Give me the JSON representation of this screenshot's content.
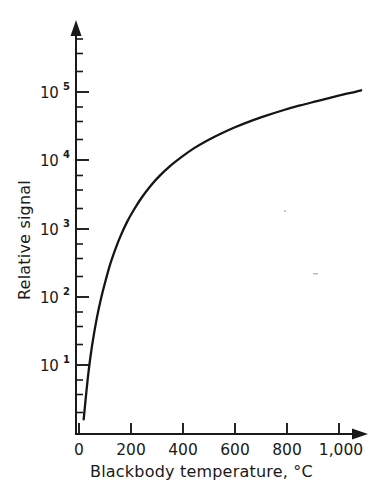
{
  "chart_data": {
    "type": "line",
    "title": "",
    "xlabel": "Blackbody temperature, °C",
    "ylabel": "Relative signal",
    "xlim": [
      0,
      1100
    ],
    "ylim": [
      1,
      200000
    ],
    "yscale": "log",
    "xscale": "linear",
    "grid": false,
    "legend": null,
    "x_ticks": [
      {
        "value": 0,
        "label": "0"
      },
      {
        "value": 200,
        "label": "200"
      },
      {
        "value": 400,
        "label": "400"
      },
      {
        "value": 600,
        "label": "600"
      },
      {
        "value": 800,
        "label": "800"
      },
      {
        "value": 1000,
        "label": "1,000"
      }
    ],
    "y_ticks": [
      {
        "value": 10,
        "mantissa": "10",
        "exponent": "1",
        "label": "10¹"
      },
      {
        "value": 100,
        "mantissa": "10",
        "exponent": "2",
        "label": "10²"
      },
      {
        "value": 1000,
        "mantissa": "10",
        "exponent": "3",
        "label": "10³"
      },
      {
        "value": 10000,
        "mantissa": "10",
        "exponent": "4",
        "label": "10⁴"
      },
      {
        "value": 100000,
        "mantissa": "10",
        "exponent": "5",
        "label": "10⁵"
      }
    ],
    "series": [
      {
        "name": "Relative signal",
        "x": [
          18,
          25,
          35,
          45,
          55,
          70,
          85,
          100,
          120,
          140,
          160,
          185,
          210,
          240,
          275,
          310,
          350,
          395,
          440,
          490,
          545,
          600,
          660,
          720,
          785,
          850,
          915,
          980,
          1040,
          1085
        ],
        "y": [
          1.6,
          3.0,
          7.0,
          14,
          25,
          52,
          95,
          160,
          300,
          500,
          780,
          1250,
          1850,
          2800,
          4200,
          5900,
          8200,
          11200,
          14800,
          19200,
          24500,
          30500,
          37500,
          45000,
          54000,
          63500,
          73500,
          85000,
          96000,
          106000
        ]
      }
    ],
    "annotations": [],
    "colors": {
      "curve": "#151515",
      "axis": "#1a1a1a",
      "background": "#ffffff"
    }
  },
  "axes": {
    "y_axis_title": "Relative signal",
    "x_axis_title": "Blackbody temperature, °C"
  },
  "figure": {
    "background": "#ffffff"
  }
}
